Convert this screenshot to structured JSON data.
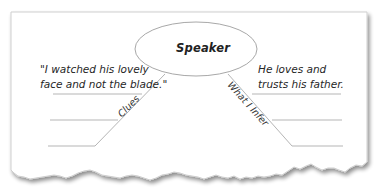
{
  "diagram": {
    "type": "inference-chart",
    "center": {
      "label": "Speaker",
      "shape": "ellipse"
    },
    "left_branch": {
      "label": "Clues",
      "text_lines": [
        "\"I watched his lovely",
        "face and not the blade.\""
      ],
      "blank_lines": 2
    },
    "right_branch": {
      "label": "What I Infer",
      "text_lines": [
        "He loves and",
        "trusts his father."
      ],
      "blank_lines": 2
    },
    "colors": {
      "paper": "#ffffff",
      "paper_border": "#c8c8c8",
      "shadow": "#9a9a9a",
      "lines": "#b5b5b5",
      "ellipse_stroke": "#a8a8a8",
      "text": "#222222"
    }
  }
}
